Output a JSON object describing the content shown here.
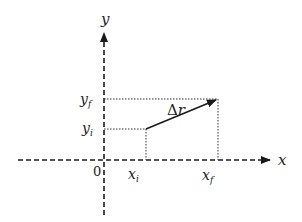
{
  "diagram": {
    "axes": {
      "x_label": "x",
      "y_label": "y",
      "origin_label": "0"
    },
    "points": {
      "initial": {
        "x_label": "x",
        "x_sub": "i",
        "y_label": "y",
        "y_sub": "i"
      },
      "final": {
        "x_label": "x",
        "x_sub": "f",
        "y_label": "y",
        "y_sub": "f"
      }
    },
    "vector": {
      "label_symbol": "Δ",
      "label_var": "r"
    },
    "colors": {
      "line": "#1a1a1a",
      "background": "#ffffff"
    }
  }
}
